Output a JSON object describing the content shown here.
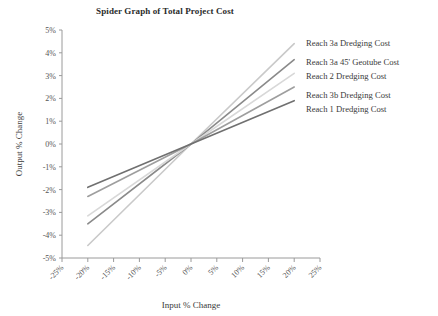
{
  "chart_data": {
    "type": "line",
    "title": "Spider Graph of Total Project Cost",
    "xlabel": "Input % Change",
    "ylabel": "Output % Change",
    "xlim": [
      -25,
      25
    ],
    "ylim": [
      -5,
      5
    ],
    "grid": false,
    "legend_position": "right-inline-labels",
    "xticks": [
      -25,
      -20,
      -15,
      -10,
      -5,
      0,
      5,
      10,
      15,
      20,
      25
    ],
    "xtick_labels": [
      "-25%",
      "-20%",
      "-15%",
      "-10%",
      "-5%",
      "0%",
      "5%",
      "10%",
      "15%",
      "20%",
      "25%"
    ],
    "yticks": [
      -5,
      -4,
      -3,
      -2,
      -1,
      0,
      1,
      2,
      3,
      4,
      5
    ],
    "ytick_labels": [
      "-5%",
      "-4%",
      "-3%",
      "-2%",
      "-1%",
      "0%",
      "1%",
      "2%",
      "3%",
      "4%",
      "5%"
    ],
    "x": [
      -20,
      0,
      20
    ],
    "series": [
      {
        "name": "Reach 3a Dredging Cost",
        "color": "#c9c9c9",
        "values": [
          -4.45,
          0,
          4.4
        ]
      },
      {
        "name": "Reach 3a 45' Geotube Cost",
        "color": "#8a8a8a",
        "values": [
          -3.5,
          0,
          3.7
        ]
      },
      {
        "name": "Reach 2 Dredging Cost",
        "color": "#d8d8d8",
        "values": [
          -3.15,
          0,
          3.1
        ]
      },
      {
        "name": "Reach 3b Dredging Cost",
        "color": "#9e9e9e",
        "values": [
          -2.3,
          0,
          2.5
        ]
      },
      {
        "name": "Reach 1 Dredging Cost",
        "color": "#707070",
        "values": [
          -1.9,
          0,
          1.9
        ]
      }
    ],
    "legend_entries": [
      {
        "label": "Reach 3a Dredging Cost",
        "top": 38
      },
      {
        "label": "Reach 3a 45' Geotube Cost",
        "top": 57
      },
      {
        "label": "Reach 2 Dredging Cost",
        "top": 71
      },
      {
        "label": "Reach 3b Dredging Cost",
        "top": 90
      },
      {
        "label": "Reach 1 Dredging Cost",
        "top": 104
      }
    ]
  }
}
